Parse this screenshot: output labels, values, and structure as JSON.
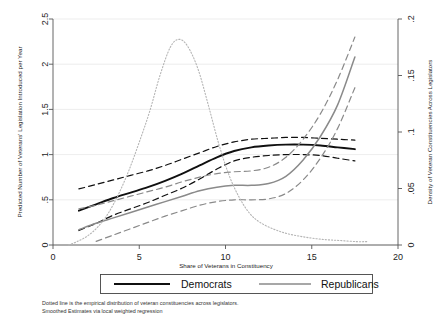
{
  "chart_data": {
    "type": "line",
    "title": "",
    "xlabel": "Share of Veterans in Constituency",
    "ylabel": "Predicted Number of Veterans' Legislation Introduced per Year",
    "y2label": "Density of Veteran Constituencies Across Legislators",
    "xlim": [
      0,
      20
    ],
    "ylim": [
      0,
      2.5
    ],
    "y2lim": [
      0,
      0.2
    ],
    "xticks": [
      "0",
      "5",
      "10",
      "15",
      "20"
    ],
    "xtick_values": [
      0,
      5,
      10,
      15,
      20
    ],
    "yticks": [
      "0",
      ".5",
      "1",
      "1.5",
      "2",
      "2.5"
    ],
    "ytick_values": [
      0,
      0.5,
      1,
      1.5,
      2,
      2.5
    ],
    "y2ticks": [
      "0",
      ".05",
      ".1",
      ".15",
      ".2"
    ],
    "y2tick_values": [
      0,
      0.05,
      0.1,
      0.15,
      0.2
    ],
    "grid": true,
    "grid_axis": "y",
    "legend_position": "below-axes",
    "series": [
      {
        "name": "Democrats",
        "style": "solid",
        "color": "#101010",
        "width": 1.9,
        "axis": "left",
        "x": [
          1.5,
          2.5,
          3.5,
          4.5,
          5.5,
          6.5,
          7.5,
          8.5,
          9.5,
          10.5,
          11.5,
          12.5,
          13.5,
          14.5,
          15.5,
          16.5,
          17.5
        ],
        "y": [
          0.38,
          0.45,
          0.52,
          0.58,
          0.64,
          0.71,
          0.79,
          0.88,
          0.97,
          1.04,
          1.08,
          1.1,
          1.11,
          1.11,
          1.1,
          1.08,
          1.06
        ]
      },
      {
        "name": "Democrats upper CI",
        "style": "dashed",
        "color": "#101010",
        "width": 1.2,
        "axis": "left",
        "x": [
          1.5,
          2.5,
          3.5,
          4.5,
          5.5,
          6.5,
          7.5,
          8.5,
          9.5,
          10.5,
          11.5,
          12.5,
          13.5,
          14.5,
          15.5,
          16.5,
          17.5
        ],
        "y": [
          0.62,
          0.67,
          0.72,
          0.77,
          0.82,
          0.88,
          0.95,
          1.02,
          1.09,
          1.14,
          1.17,
          1.18,
          1.19,
          1.19,
          1.18,
          1.17,
          1.16
        ]
      },
      {
        "name": "Democrats lower CI",
        "style": "dashed",
        "color": "#101010",
        "width": 1.2,
        "axis": "left",
        "x": [
          1.5,
          2.5,
          3.5,
          4.5,
          5.5,
          6.5,
          7.5,
          8.5,
          9.5,
          10.5,
          11.5,
          12.5,
          13.5,
          14.5,
          15.5,
          16.5,
          17.5
        ],
        "y": [
          0.16,
          0.24,
          0.33,
          0.4,
          0.47,
          0.55,
          0.63,
          0.73,
          0.84,
          0.93,
          0.97,
          0.99,
          1.0,
          1.0,
          0.99,
          0.96,
          0.93
        ]
      },
      {
        "name": "Republicans",
        "style": "solid",
        "color": "#8a8a8a",
        "width": 1.5,
        "axis": "left",
        "x": [
          1.5,
          2.5,
          3.5,
          4.5,
          5.5,
          6.5,
          7.5,
          8.5,
          9.5,
          10.5,
          11.5,
          12.5,
          13.5,
          14.5,
          15.5,
          16.5,
          17.5
        ],
        "y": [
          0.17,
          0.24,
          0.3,
          0.36,
          0.42,
          0.48,
          0.54,
          0.6,
          0.64,
          0.66,
          0.66,
          0.68,
          0.76,
          0.94,
          1.2,
          1.55,
          2.08
        ]
      },
      {
        "name": "Republicans upper CI",
        "style": "dashed",
        "color": "#8a8a8a",
        "width": 1.2,
        "axis": "left",
        "x": [
          1.5,
          2.5,
          3.5,
          4.5,
          5.5,
          6.5,
          7.5,
          8.5,
          9.5,
          10.5,
          11.5,
          12.5,
          13.5,
          14.5,
          15.5,
          16.5,
          17.5
        ],
        "y": [
          0.4,
          0.44,
          0.49,
          0.54,
          0.59,
          0.64,
          0.7,
          0.75,
          0.79,
          0.81,
          0.82,
          0.86,
          0.97,
          1.17,
          1.45,
          1.83,
          2.3
        ]
      },
      {
        "name": "Republicans lower CI",
        "style": "dashed",
        "color": "#8a8a8a",
        "width": 1.2,
        "axis": "left",
        "x": [
          2.5,
          3.5,
          4.5,
          5.5,
          6.5,
          7.5,
          8.5,
          9.5,
          10.5,
          11.5,
          12.5,
          13.5,
          14.5,
          15.5,
          16.5,
          17.5
        ],
        "y": [
          0.04,
          0.11,
          0.18,
          0.25,
          0.32,
          0.38,
          0.44,
          0.48,
          0.5,
          0.5,
          0.51,
          0.57,
          0.72,
          0.96,
          1.29,
          1.74
        ]
      },
      {
        "name": "Empirical density of veteran constituencies",
        "style": "dotted",
        "color": "#b5b5b5",
        "width": 1.1,
        "axis": "right",
        "x": [
          0.9,
          1.4,
          2.0,
          2.6,
          3.2,
          3.8,
          4.4,
          5.0,
          5.6,
          6.2,
          6.8,
          7.3,
          7.8,
          8.4,
          9.0,
          9.6,
          10.2,
          10.8,
          11.4,
          12.0,
          12.8,
          13.6,
          14.6,
          15.6,
          16.6,
          17.6,
          18.2
        ],
        "y_right": [
          0.0,
          0.003,
          0.008,
          0.016,
          0.028,
          0.045,
          0.066,
          0.091,
          0.118,
          0.15,
          0.175,
          0.182,
          0.176,
          0.156,
          0.124,
          0.09,
          0.062,
          0.042,
          0.028,
          0.02,
          0.014,
          0.01,
          0.007,
          0.005,
          0.004,
          0.003,
          0.003
        ]
      }
    ],
    "annotations": [
      "Dotted line is the empirical distribution of veteran constituencies across legislators.",
      "Smoothed Estimates via local weighted regression"
    ]
  },
  "legend": {
    "entries": [
      {
        "label": "Democrats",
        "color": "#101010",
        "width": 2.0
      },
      {
        "label": "Republicans",
        "color": "#8a8a8a",
        "width": 1.3
      }
    ]
  },
  "notes": {
    "line1": "Dotted line is the empirical distribution of veteran constituencies across legislators.",
    "line2": "Smoothed Estimates via local weighted regression"
  },
  "axes": {
    "x_title": "Share of Veterans in Constituency",
    "y_title": "Predicted Number of Veterans' Legislation Introduced per Year",
    "y2_title": "Density of Veteran Constituencies Across Legislators"
  }
}
